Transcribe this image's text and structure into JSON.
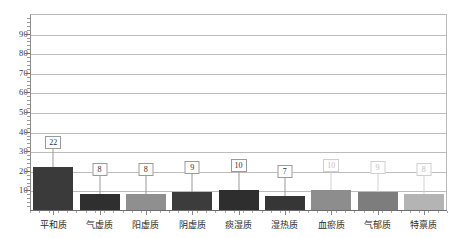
{
  "chart_data": {
    "type": "bar",
    "title": "",
    "subtitle": "",
    "xlabel": "",
    "ylabel": "",
    "categories": [
      "平和质",
      "气虚质",
      "阳虚质",
      "阴虚质",
      "痰湿质",
      "湿热质",
      "血瘀质",
      "气郁质",
      "特禀质"
    ],
    "values": [
      22,
      8,
      8,
      9,
      10,
      7,
      10,
      9,
      8
    ],
    "value_labels": [
      "22",
      "8",
      "8",
      "9",
      "10",
      "7",
      "10",
      "9",
      "8"
    ],
    "bar_colors": [
      "#3a3a3a",
      "#2f2f2f",
      "#8f8f8f",
      "#3c3c3c",
      "#2e2e2e",
      "#363636",
      "#8d8d8d",
      "#7d7d7d",
      "#b4b4b4"
    ],
    "label_faint": [
      false,
      false,
      false,
      false,
      false,
      false,
      true,
      true,
      true
    ],
    "ylim": [
      0,
      100
    ],
    "yticks": [
      10,
      20,
      30,
      40,
      50,
      60,
      70,
      80,
      90
    ],
    "ytick_labels": [
      "10",
      "20",
      "30",
      "40",
      "50",
      "60",
      "70",
      "80",
      "90"
    ],
    "grid": true,
    "legend": "none",
    "legend_position": "none"
  },
  "axis": {
    "y_top_unlabeled_tick": "",
    "x_axis_visible": true,
    "y_axis_visible": true
  }
}
